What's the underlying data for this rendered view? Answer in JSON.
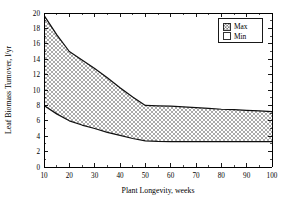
{
  "chart_data": {
    "type": "area",
    "title": "",
    "xlabel": "Plant Longevity, weeks",
    "ylabel": "Leaf Biomass Turnover, l/yr",
    "xlim": [
      10,
      100
    ],
    "ylim": [
      0,
      20
    ],
    "grid": false,
    "legend_position": "top-right-inside",
    "x_ticks": [
      10,
      20,
      30,
      40,
      50,
      60,
      70,
      80,
      90,
      100
    ],
    "x_tick_labels": [
      "10",
      "20",
      "30",
      "40",
      "50",
      "60",
      "70",
      "80",
      "90",
      "100"
    ],
    "x_minor_ticks": [
      15,
      25,
      35,
      45,
      55,
      65,
      75,
      85,
      95
    ],
    "y_ticks": [
      0,
      2,
      4,
      6,
      8,
      10,
      12,
      14,
      16,
      18,
      20
    ],
    "y_tick_labels": [
      "0",
      "2",
      "4",
      "6",
      "8",
      "10",
      "12",
      "14",
      "16",
      "18",
      "20"
    ],
    "y_minor_ticks": [
      1,
      3,
      5,
      7,
      9,
      11,
      13,
      15,
      17,
      19
    ],
    "x": [
      10,
      15,
      20,
      25,
      30,
      35,
      40,
      45,
      50,
      55,
      60,
      65,
      70,
      75,
      80,
      85,
      90,
      95,
      100
    ],
    "series": [
      {
        "name": "Max",
        "fill_pattern": "crosshatch",
        "values": [
          19.7,
          17.2,
          15.0,
          13.9,
          12.8,
          11.6,
          10.3,
          9.1,
          8.0,
          7.95,
          7.9,
          7.8,
          7.7,
          7.6,
          7.5,
          7.45,
          7.35,
          7.28,
          7.2
        ]
      },
      {
        "name": "Min",
        "fill_pattern": "none",
        "values": [
          8.0,
          6.9,
          6.0,
          5.45,
          5.0,
          4.5,
          4.1,
          3.7,
          3.4,
          3.33,
          3.3,
          3.3,
          3.3,
          3.3,
          3.3,
          3.3,
          3.3,
          3.3,
          3.3
        ]
      }
    ],
    "legend": [
      {
        "label": "Max",
        "swatch": "crosshatch"
      },
      {
        "label": "Min",
        "swatch": "empty"
      }
    ],
    "colors": {
      "axis": "#000000",
      "curve": "#101010",
      "fill": "#9a9a9a",
      "background": "#ffffff"
    }
  }
}
